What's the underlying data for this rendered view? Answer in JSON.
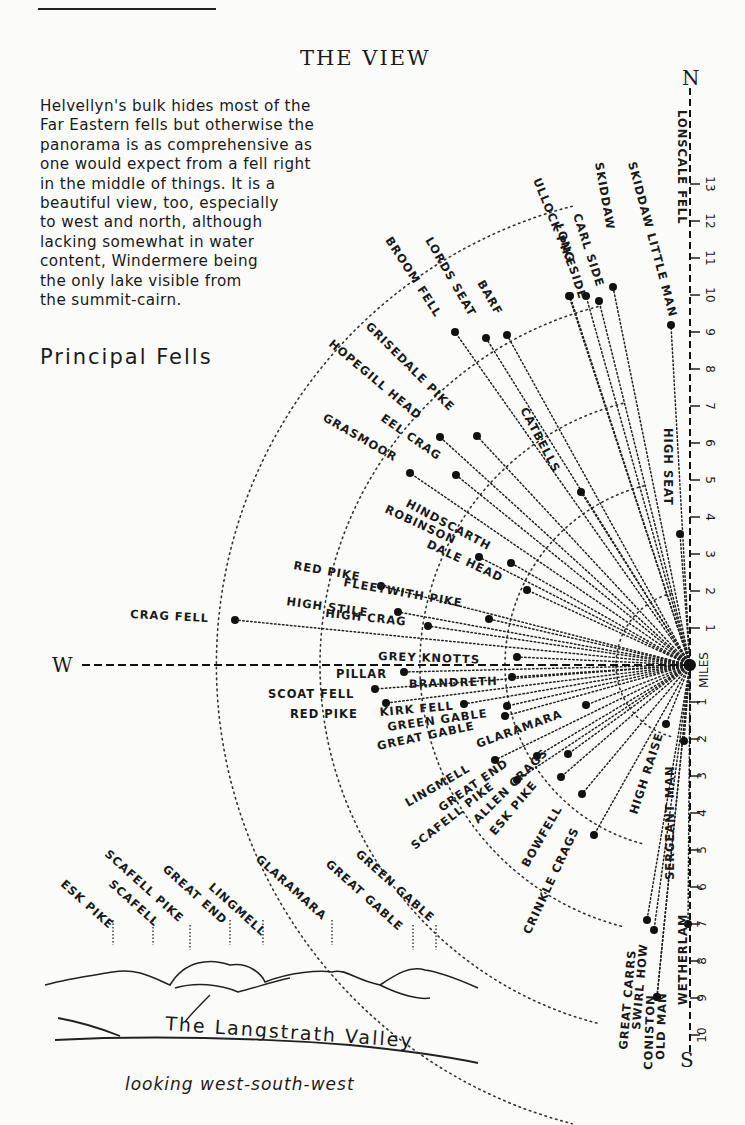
{
  "page": {
    "title": "THE VIEW",
    "intro": "Helvellyn's bulk hides most of the\nFar Eastern fells but otherwise the\npanorama is as comprehensive as\none would expect from a fell right\nin the middle of things.  It is a\nbeautiful view, too, especially\nto west and north, although\nlacking somewhat in water\ncontent, Windermere being\nthe only lake visible from\nthe summit-cairn.",
    "subtitle": "Principal Fells"
  },
  "diagram": {
    "origin": [
      690,
      665
    ],
    "px_per_mile": 37,
    "axes": {
      "north": "N",
      "south": "S",
      "west": "W",
      "scale_label": "MILES"
    },
    "north_ticks": [
      1,
      2,
      3,
      4,
      5,
      6,
      7,
      8,
      9,
      10,
      11,
      12,
      13
    ],
    "south_ticks": [
      1,
      2,
      3,
      4,
      5,
      6,
      7,
      8,
      9,
      10
    ],
    "arcs_miles": [
      2,
      5,
      7.3,
      10,
      12.8
    ],
    "fells": [
      {
        "name": "LONSCALE FELL",
        "x": 671,
        "y": 325,
        "lx": 678,
        "ly": 110,
        "rot": 90
      },
      {
        "name": "SKIDDAW LITTLE MAN",
        "x": 613,
        "y": 287,
        "lx": 628,
        "ly": 163,
        "rot": 75
      },
      {
        "name": "SKIDDAW",
        "x": 599,
        "y": 301,
        "lx": 595,
        "ly": 163,
        "rot": 80
      },
      {
        "name": "CARL SIDE",
        "x": 586,
        "y": 296,
        "lx": 573,
        "ly": 215,
        "rot": 72
      },
      {
        "name": "LONG SIDE",
        "x": 570,
        "y": 296,
        "lx": 555,
        "ly": 225,
        "rot": 72
      },
      {
        "name": "ULLOCK PIKE",
        "x": 569,
        "y": 296,
        "lx": 533,
        "ly": 180,
        "rot": 68
      },
      {
        "name": "BARF",
        "x": 507,
        "y": 335,
        "lx": 477,
        "ly": 283,
        "rot": 60
      },
      {
        "name": "LORDS SEAT",
        "x": 486,
        "y": 338,
        "lx": 425,
        "ly": 240,
        "rot": 60
      },
      {
        "name": "BROOM FELL",
        "x": 455,
        "y": 332,
        "lx": 385,
        "ly": 240,
        "rot": 57
      },
      {
        "name": "CATBELLS",
        "x": 581,
        "y": 492,
        "lx": 520,
        "ly": 410,
        "rot": 62
      },
      {
        "name": "GRISEDALE PIKE",
        "x": 440,
        "y": 437,
        "lx": 365,
        "ly": 327,
        "rot": 45
      },
      {
        "name": "HOPEGILL HEAD",
        "x": 477,
        "y": 436,
        "lx": 328,
        "ly": 345,
        "rot": 40
      },
      {
        "name": "EEL CRAG",
        "x": 456,
        "y": 475,
        "lx": 380,
        "ly": 420,
        "rot": 35
      },
      {
        "name": "GRASMOOR",
        "x": 410,
        "y": 473,
        "lx": 322,
        "ly": 420,
        "rot": 30
      },
      {
        "name": "HINDSCARTH",
        "x": 511,
        "y": 563,
        "lx": 405,
        "ly": 506,
        "rot": 28
      },
      {
        "name": "ROBINSON",
        "x": 479,
        "y": 557,
        "lx": 384,
        "ly": 512,
        "rot": 25
      },
      {
        "name": "DALE HEAD",
        "x": 527,
        "y": 590,
        "lx": 426,
        "ly": 547,
        "rot": 25
      },
      {
        "name": "HIGH SEAT",
        "x": 680,
        "y": 534,
        "lx": 664,
        "ly": 428,
        "rot": 90
      },
      {
        "name": "RED PIKE (BUTTERMERE)",
        "label": "RED PIKE",
        "x": 381,
        "y": 586,
        "lx": 293,
        "ly": 569,
        "rot": 10
      },
      {
        "name": "FLEETWITH PIKE",
        "x": 489,
        "y": 619,
        "lx": 343,
        "ly": 586,
        "rot": 10
      },
      {
        "name": "HIGH STILE",
        "x": 398,
        "y": 612,
        "lx": 286,
        "ly": 605,
        "rot": 8
      },
      {
        "name": "HIGH CRAG",
        "x": 428,
        "y": 626,
        "lx": 325,
        "ly": 617,
        "rot": 6
      },
      {
        "name": "CRAG FELL",
        "x": 235,
        "y": 620,
        "lx": 130,
        "ly": 618,
        "rot": 3
      },
      {
        "name": "GREY KNOTTS",
        "x": 517,
        "y": 657,
        "lx": 378,
        "ly": 660,
        "rot": 2
      },
      {
        "name": "PILLAR",
        "x": 404,
        "y": 672,
        "lx": 336,
        "ly": 678,
        "rot": 0
      },
      {
        "name": "BRANDRETH",
        "x": 512,
        "y": 677,
        "lx": 409,
        "ly": 688,
        "rot": -2
      },
      {
        "name": "SCOAT FELL",
        "x": 375,
        "y": 689,
        "lx": 268,
        "ly": 698,
        "rot": 0
      },
      {
        "name": "RED PIKE (WASDALE)",
        "label": "RED PIKE",
        "x": 386,
        "y": 703,
        "lx": 290,
        "ly": 718,
        "rot": 0
      },
      {
        "name": "KIRK FELL",
        "x": 464,
        "y": 704,
        "lx": 380,
        "ly": 716,
        "rot": -5
      },
      {
        "name": "GREEN GABLE",
        "x": 507,
        "y": 706,
        "lx": 388,
        "ly": 731,
        "rot": -8
      },
      {
        "name": "GREAT GABLE",
        "x": 505,
        "y": 716,
        "lx": 378,
        "ly": 750,
        "rot": -12
      },
      {
        "name": "GLARAMARA",
        "x": 586,
        "y": 705,
        "lx": 478,
        "ly": 748,
        "rot": -20
      },
      {
        "name": "LINGMELL",
        "x": 495,
        "y": 760,
        "lx": 408,
        "ly": 807,
        "rot": -30
      },
      {
        "name": "GREAT END",
        "x": 537,
        "y": 756,
        "lx": 442,
        "ly": 812,
        "rot": -35
      },
      {
        "name": "SCAFELL PIKE",
        "x": 517,
        "y": 780,
        "lx": 415,
        "ly": 850,
        "rot": -38
      },
      {
        "name": "ALLEN CRAGS",
        "x": 568,
        "y": 754,
        "lx": 478,
        "ly": 824,
        "rot": -45
      },
      {
        "name": "ESK PIKE",
        "x": 561,
        "y": 777,
        "lx": 495,
        "ly": 836,
        "rot": -50
      },
      {
        "name": "BOWFELL",
        "x": 582,
        "y": 794,
        "lx": 528,
        "ly": 868,
        "rot": -60
      },
      {
        "name": "CRINKLE CRAGS",
        "x": 594,
        "y": 835,
        "lx": 530,
        "ly": 935,
        "rot": -65
      },
      {
        "name": "HIGH RAISE",
        "x": 666,
        "y": 724,
        "lx": 637,
        "ly": 815,
        "rot": -72
      },
      {
        "name": "SERGEANT MAN",
        "x": 684,
        "y": 741,
        "lx": 674,
        "ly": 880,
        "rot": -90
      },
      {
        "name": "GREAT CARRS",
        "x": 647,
        "y": 920,
        "lx": 627,
        "ly": 1050,
        "rot": -85
      },
      {
        "name": "SWIRL HOW",
        "x": 654,
        "y": 930,
        "lx": 640,
        "ly": 1030,
        "rot": -85
      },
      {
        "name": "CONISTON OLD MAN",
        "label": "CONISTON",
        "x": 657,
        "y": 997,
        "lx": 652,
        "ly": 1070,
        "rot": -88
      },
      {
        "name": "OLD MAN",
        "x": 657,
        "y": 997,
        "lx": 664,
        "ly": 1060,
        "rot": -88
      },
      {
        "name": "WETHERLAM",
        "x": 688,
        "y": 924,
        "lx": 687,
        "ly": 1005,
        "rot": -90
      }
    ]
  },
  "inset": {
    "caption_valley": "The Langstrath Valley",
    "caption_direction": "looking west-south-west",
    "peaks": [
      {
        "label": "ESK PIKE",
        "x": 113,
        "y": 945,
        "lx": 60,
        "ly": 885
      },
      {
        "label": "SCAFELL",
        "x": 153,
        "y": 945,
        "lx": 108,
        "ly": 885
      },
      {
        "label": "SCAFELL PIKE",
        "x": 190,
        "y": 950,
        "lx": 104,
        "ly": 855
      },
      {
        "label": "GREAT END",
        "x": 230,
        "y": 945,
        "lx": 162,
        "ly": 870
      },
      {
        "label": "LINGMELL",
        "x": 263,
        "y": 945,
        "lx": 208,
        "ly": 888
      },
      {
        "label": "GLARAMARA",
        "x": 332,
        "y": 945,
        "lx": 255,
        "ly": 860
      },
      {
        "label": "GREAT GABLE",
        "x": 413,
        "y": 950,
        "lx": 325,
        "ly": 865
      },
      {
        "label": "GREEN GABLE",
        "x": 436,
        "y": 950,
        "lx": 355,
        "ly": 855
      }
    ]
  }
}
